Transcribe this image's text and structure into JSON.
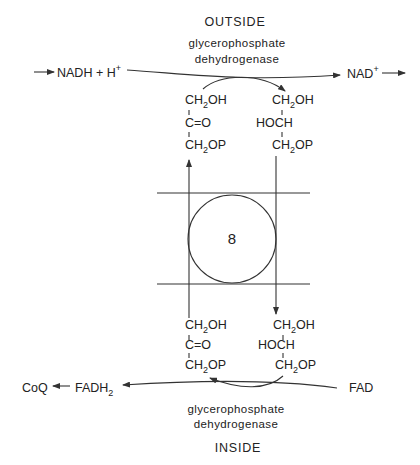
{
  "top": {
    "compartment": "OUTSIDE",
    "enzyme_line1": "glycerophosphate",
    "enzyme_line2": "dehydrogenase",
    "reactant": "NADH + H",
    "reactant_sup": "+",
    "product": "NAD",
    "product_sup": "+",
    "left_molecule": {
      "line1": "CH",
      "line1_sub": "2",
      "line1_end": "OH",
      "bond1": "I",
      "line2": "C=O",
      "bond2": "I",
      "line3": "CH",
      "line3_sub": "2",
      "line3_end": "OP"
    },
    "right_molecule": {
      "line1": "CH",
      "line1_sub": "2",
      "line1_end": "OH",
      "bond1": "I",
      "line2": "HOCH",
      "bond2": "I",
      "line3": "CH",
      "line3_sub": "2",
      "line3_end": "OP"
    }
  },
  "membrane": {
    "carrier_label": "8"
  },
  "bottom": {
    "compartment": "INSIDE",
    "enzyme_line1": "glycerophosphate",
    "enzyme_line2": "dehydrogenase",
    "reactant": "FAD",
    "product": "FADH",
    "product_sub": "2",
    "acceptor": "CoQ",
    "left_molecule": {
      "line1": "CH",
      "line1_sub": "2",
      "line1_end": "OH",
      "bond1": "I",
      "line2": "C=O",
      "bond2": "I",
      "line3": "CH",
      "line3_sub": "2",
      "line3_end": "OP"
    },
    "right_molecule": {
      "line1": "CH",
      "line1_sub": "2",
      "line1_end": "OH",
      "bond1": "I",
      "line2": "HOCH",
      "bond2": "I",
      "line3": "CH",
      "line3_sub": "2",
      "line3_end": "OP"
    }
  }
}
